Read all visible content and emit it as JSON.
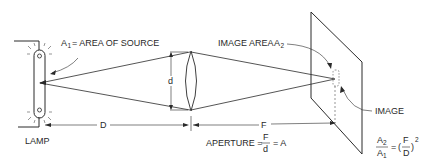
{
  "colors": {
    "ink": "#2a2a2a",
    "background": "#ffffff"
  },
  "labels": {
    "source_area": {
      "symbol": "A",
      "subscript": "1",
      "text": "= AREA OF SOURCE"
    },
    "image_area": {
      "text": "IMAGE AREA",
      "symbol": "A",
      "subscript": "2"
    },
    "lens_diameter": "d",
    "distance_source": "D",
    "distance_focal": "F",
    "image": "IMAGE",
    "lamp": "LAMP",
    "aperture": {
      "prefix": "APERTURE =",
      "numerator": "F",
      "denominator": "d",
      "suffix": "= A"
    },
    "ratio_formula": {
      "lhs_num_symbol": "A",
      "lhs_num_sub": "2",
      "lhs_den_symbol": "A",
      "lhs_den_sub": "1",
      "equals": "=",
      "open_paren": "(",
      "rhs_num": "F",
      "rhs_den": "D",
      "close_paren": ")",
      "exponent": "2"
    }
  }
}
